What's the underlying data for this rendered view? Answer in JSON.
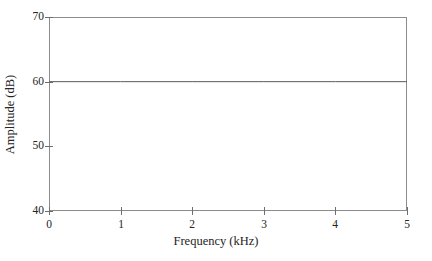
{
  "chart_data": {
    "type": "line",
    "title": "",
    "subtitle": "",
    "xlabel": "Frequency (kHz)",
    "ylabel": "Amplitude (dB)",
    "xlim": [
      0,
      5
    ],
    "ylim": [
      40,
      70
    ],
    "xticks": [
      "0",
      "1",
      "2",
      "3",
      "4",
      "5"
    ],
    "yticks": [
      "40",
      "50",
      "60",
      "70"
    ],
    "xtick_values": [
      0,
      1,
      2,
      3,
      4,
      5
    ],
    "ytick_values": [
      40,
      50,
      60,
      70
    ],
    "grid": false,
    "legend": false,
    "legend_position": "none",
    "frame": "box",
    "series": [
      {
        "name": "Amplitude",
        "x": [
          0,
          1,
          2,
          3,
          4,
          5
        ],
        "values": [
          60,
          60,
          60,
          60,
          60,
          60
        ],
        "color": "#595959",
        "linewidth": 1
      }
    ]
  },
  "axes": {
    "x": {
      "title": "Frequency (kHz)",
      "ticks": [
        {
          "label": "0",
          "value": 0
        },
        {
          "label": "1",
          "value": 1
        },
        {
          "label": "2",
          "value": 2
        },
        {
          "label": "3",
          "value": 3
        },
        {
          "label": "4",
          "value": 4
        },
        {
          "label": "5",
          "value": 5
        }
      ]
    },
    "y": {
      "title": "Amplitude (dB)",
      "ticks": [
        {
          "label": "40",
          "value": 40
        },
        {
          "label": "50",
          "value": 50
        },
        {
          "label": "60",
          "value": 60
        },
        {
          "label": "70",
          "value": 70
        }
      ]
    }
  },
  "colors": {
    "background": "#ffffff",
    "frame": "#8c8c8c",
    "tick": "#6e6e6e",
    "data_line": "#595959",
    "text": "#242424"
  }
}
